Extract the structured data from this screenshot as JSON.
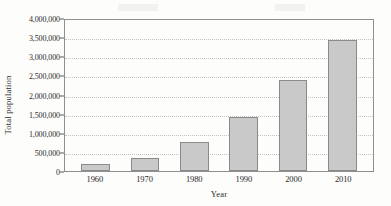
{
  "chart_data": {
    "type": "bar",
    "title": "",
    "xlabel": "Year",
    "ylabel": "Total population",
    "categories": [
      "1960",
      "1970",
      "1980",
      "1990",
      "2000",
      "2010"
    ],
    "values": [
      180000,
      340000,
      760000,
      1410000,
      2380000,
      3420000
    ],
    "ylim": [
      0,
      4000000
    ],
    "ytick_labels": [
      "4,000,000",
      "3,500,000",
      "3,000,000",
      "2,500,000",
      "2,000,000",
      "1,500,000",
      "1,000,000",
      "500,000",
      "0"
    ],
    "ytick_values": [
      4000000,
      3500000,
      3000000,
      2500000,
      2000000,
      1500000,
      1000000,
      500000,
      0
    ],
    "grid": true,
    "legend": "none",
    "bar_color": "#c9c9c9",
    "bar_border_color": "#8a8a8a",
    "frame_color": "#8f8f8f",
    "gridline_color": "#c4c4c4"
  }
}
